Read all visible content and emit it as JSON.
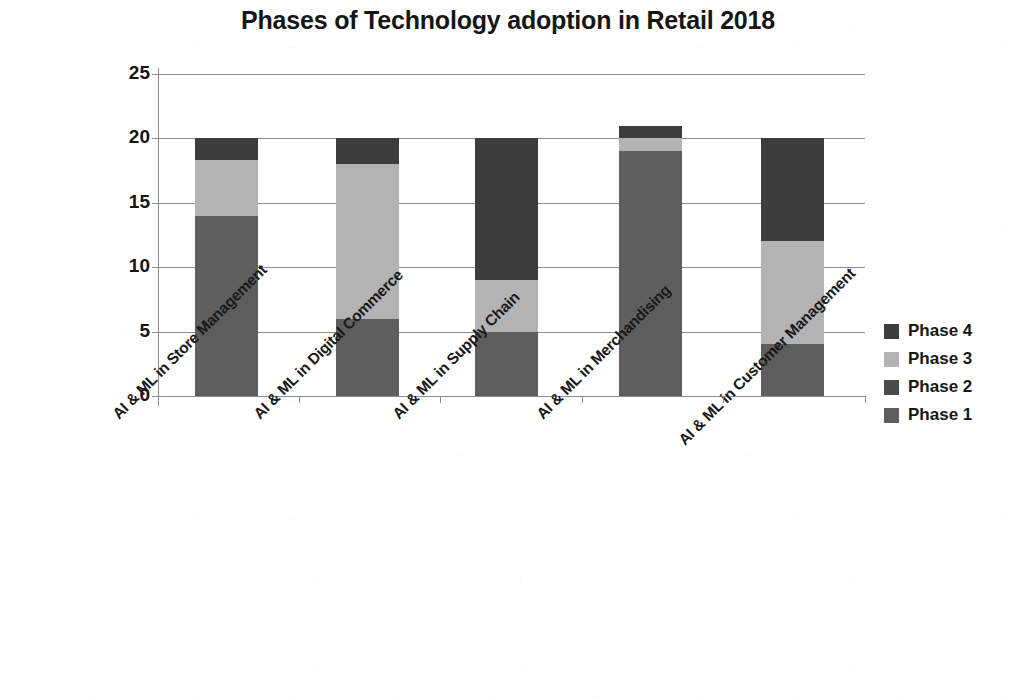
{
  "chart_data": {
    "type": "bar",
    "subtype": "stacked-vertical",
    "title": "Phases of Technology adoption in Retail 2018",
    "xlabel": "",
    "ylabel": "",
    "ylim": [
      0,
      25
    ],
    "yticks": [
      0,
      5,
      10,
      15,
      20,
      25
    ],
    "grid": true,
    "legend_position": "right",
    "categories": [
      "AI & ML in Store Management",
      "AI & ML in Digital Commerce",
      "AI & ML in Supply Chain",
      "AI & ML in Merchandising",
      "AI  & ML in Customer Management"
    ],
    "series": [
      {
        "name": "Phase 1",
        "color": "#5e5e5e",
        "values": [
          14,
          6,
          5,
          19,
          4
        ]
      },
      {
        "name": "Phase 2",
        "color": "#4a4a4a",
        "values": [
          0,
          0,
          0,
          0,
          0
        ]
      },
      {
        "name": "Phase 3",
        "color": "#b3b3b3",
        "values": [
          4.3,
          12,
          4,
          1,
          8
        ]
      },
      {
        "name": "Phase 4",
        "color": "#3d3d3d",
        "values": [
          1.7,
          2,
          11,
          1,
          8
        ]
      }
    ],
    "stack_totals": [
      20,
      20,
      20,
      21,
      20
    ]
  },
  "legend": {
    "entries": [
      {
        "label": "Phase 4",
        "color": "#3d3d3d"
      },
      {
        "label": "Phase 3",
        "color": "#b3b3b3"
      },
      {
        "label": "Phase 2",
        "color": "#4a4a4a"
      },
      {
        "label": "Phase 1",
        "color": "#5e5e5e"
      }
    ]
  },
  "colors": {
    "axis": "#8d8d8d",
    "text": "#161616",
    "background": "#ffffff"
  }
}
